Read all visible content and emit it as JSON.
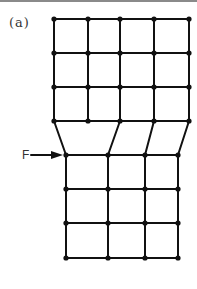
{
  "figure": {
    "panel_label": "(a)",
    "force_label": "F",
    "colors": {
      "line": "#111111",
      "node": "#111111",
      "topline": "#8a8a8a"
    }
  },
  "top_grid": {
    "xs": [
      54,
      88,
      120,
      154,
      189
    ],
    "ys": [
      19,
      53,
      87,
      121
    ]
  },
  "bottom_grid": {
    "xs": [
      66,
      108,
      145,
      178
    ],
    "ys": [
      155,
      189,
      223,
      258
    ]
  },
  "connectors": [
    {
      "from": [
        54,
        121
      ],
      "to": [
        66,
        155
      ]
    },
    {
      "from": [
        120,
        121
      ],
      "to": [
        108,
        155
      ]
    },
    {
      "from": [
        154,
        121
      ],
      "to": [
        145,
        155
      ]
    },
    {
      "from": [
        189,
        121
      ],
      "to": [
        178,
        155
      ]
    }
  ],
  "force_arrow": {
    "x1": 31,
    "x2": 63,
    "y": 155
  }
}
